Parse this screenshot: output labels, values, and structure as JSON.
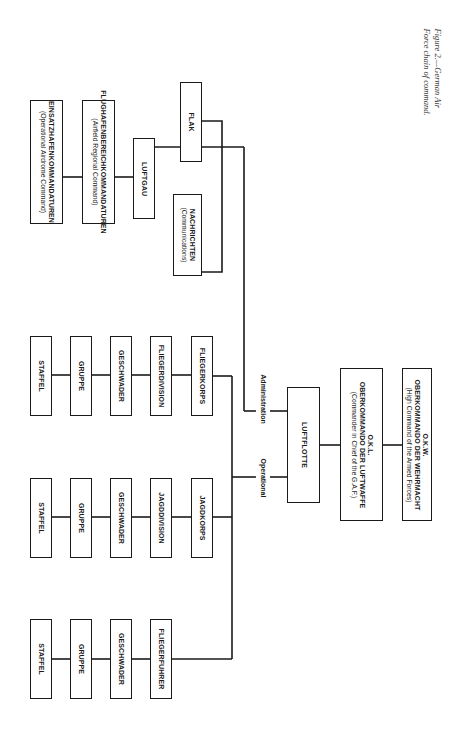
{
  "caption": {
    "line1": "Figure 2.—German Air",
    "line2": "Force chain of command."
  },
  "boxes": {
    "okw": {
      "abbr": "O.K.W.",
      "title": "OBERKOMMANDO DER WEHRMACHT",
      "subtitle": "(High Command of the Armed Forces)"
    },
    "okl": {
      "abbr": "O.K.L.",
      "title": "OBERKOMMANDO DER LUFTWAFFE",
      "subtitle": "(Commander in Chief of the G.A.F.)"
    },
    "luftflotte": {
      "title": "LUFTFLOTTE"
    },
    "luftgau": {
      "title": "LUFTGAU"
    },
    "flak": {
      "title": "FLAK"
    },
    "nachrichten": {
      "title": "NACHRICHTEN",
      "subtitle": "(Communications)"
    },
    "flughafen": {
      "title": "FLUGHAFENBEREICHKOMMANDATUREN",
      "subtitle": "(Airfield Regional Command)"
    },
    "einsatzhafen": {
      "title": "EINSATZHAFENKOMMANDATUREN",
      "subtitle": "(Operational Airdrome Command)"
    }
  },
  "branch_labels": {
    "administration": "Administration",
    "operational": "Operational"
  },
  "operational_chains": [
    {
      "items": [
        "FLIEGERKORPS",
        "FLIEGERDIVISION",
        "GESCHWADER",
        "GRUPPE",
        "STAFFEL"
      ]
    },
    {
      "items": [
        "JAGDKORPS",
        "JAGDDIVISION",
        "GESCHWADER",
        "GRUPPE",
        "STAFFEL"
      ]
    },
    {
      "items": [
        "FLIEGERFUHRER",
        "GESCHWADER",
        "GRUPPE",
        "STAFFEL"
      ]
    }
  ]
}
